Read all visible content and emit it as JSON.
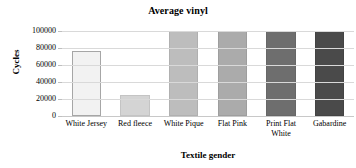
{
  "chart_data": {
    "type": "bar",
    "title": "Average vinyl",
    "xlabel": "Textile gender",
    "ylabel": "Cycles",
    "categories": [
      "White Jersey",
      "Red fleece",
      "White Pique",
      "Flat Pink",
      "Print Flat White",
      "Gabardine"
    ],
    "values": [
      77000,
      25000,
      100000,
      100000,
      100000,
      100000
    ],
    "ylim": [
      0,
      100000
    ],
    "yticks": [
      0,
      20000,
      40000,
      60000,
      80000,
      100000
    ],
    "ytick_labels": [
      "0",
      "20000",
      "40000",
      "60000",
      "80000",
      "100000"
    ],
    "grid": "horizontal",
    "legend": "none",
    "bar_colors": [
      "#f2f2f2",
      "#d4d4d4",
      "#bdbdbd",
      "#ababab",
      "#6e6e6e",
      "#4a4a4a"
    ],
    "bar_border_colors": [
      "#a6a6a6",
      "#c4c4c4",
      "#b0b0b0",
      "#9e9e9e",
      "#676767",
      "#434343"
    ],
    "grid_color": "#d9d9d9",
    "background": "#ffffff",
    "text_color": "#000000"
  }
}
